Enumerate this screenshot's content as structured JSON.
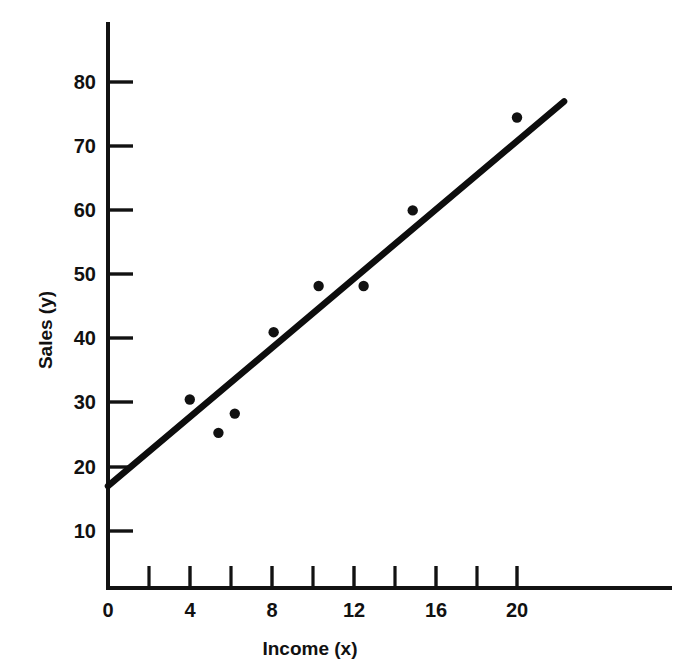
{
  "chart_data": {
    "type": "scatter",
    "title": "",
    "xlabel": "Income (x)",
    "ylabel": "Sales (y)",
    "xlim": [
      0,
      22.3
    ],
    "ylim": [
      0,
      88
    ],
    "grid": false,
    "legend": "none",
    "x_ticks_major": [
      0,
      4,
      8,
      12,
      16,
      20
    ],
    "x_ticks_minor": [
      2,
      6,
      10,
      14,
      18
    ],
    "x_ticklabels": [
      "0",
      "4",
      "8",
      "12",
      "16",
      "20"
    ],
    "y_ticks_major": [
      10,
      20,
      30,
      40,
      50,
      60,
      70,
      80
    ],
    "y_ticklabels": [
      "10",
      "20",
      "30",
      "40",
      "50",
      "60",
      "70",
      "80"
    ],
    "points": [
      {
        "x": 4.0,
        "y": 30.5
      },
      {
        "x": 5.4,
        "y": 25.3
      },
      {
        "x": 6.2,
        "y": 28.3
      },
      {
        "x": 8.1,
        "y": 41.0
      },
      {
        "x": 10.3,
        "y": 48.2
      },
      {
        "x": 12.5,
        "y": 48.2
      },
      {
        "x": 14.9,
        "y": 60.0
      },
      {
        "x": 20.0,
        "y": 74.5
      }
    ],
    "series": [
      {
        "name": "observations",
        "type": "scatter",
        "marker": "filled-circle",
        "color": "#111111",
        "x": [
          4.0,
          5.4,
          6.2,
          8.1,
          10.3,
          12.5,
          14.9,
          20.0
        ],
        "values": [
          30.5,
          25.3,
          28.3,
          41.0,
          48.2,
          48.2,
          60.0,
          74.5
        ]
      },
      {
        "name": "regression-line",
        "type": "line",
        "color": "#0d0d0d",
        "intercept": 17.0,
        "slope": 2.69,
        "x_start": 0.0,
        "y_start": 17.0,
        "x_end": 22.3,
        "y_end": 77.0
      }
    ],
    "colors": {
      "axis": "#121212",
      "marker": "#111111",
      "line": "#0d0d0d",
      "background": "#ffffff"
    }
  }
}
